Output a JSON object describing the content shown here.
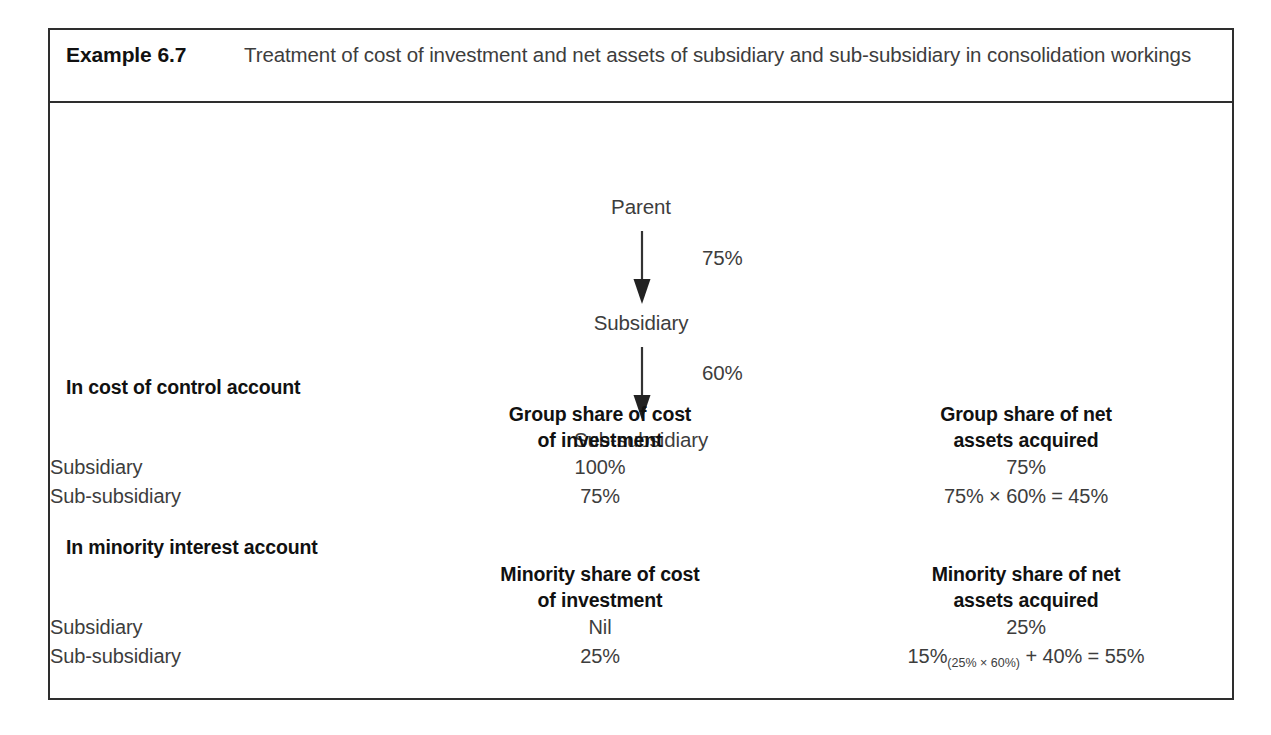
{
  "example": {
    "label": "Example 6.7",
    "title": "Treatment of cost of investment and net assets of subsidiary and sub-subsidiary in consolidation workings"
  },
  "diagram": {
    "type": "hierarchy-chain",
    "nodes": [
      {
        "id": "parent",
        "label": "Parent"
      },
      {
        "id": "subsidiary",
        "label": "Subsidiary"
      },
      {
        "id": "sub-subsidiary",
        "label": "Sub-subsidiary"
      }
    ],
    "edges": [
      {
        "from": "parent",
        "to": "subsidiary",
        "label": "75%"
      },
      {
        "from": "subsidiary",
        "to": "sub-subsidiary",
        "label": "60%"
      }
    ]
  },
  "sections": [
    {
      "id": "cost-of-control",
      "heading": "In cost of control account",
      "columns": [
        {
          "line1": "Group share of cost",
          "line2": "of investment"
        },
        {
          "line1": "Group share of net",
          "line2": "assets acquired"
        }
      ],
      "rows": [
        {
          "label": "Subsidiary",
          "col1": "100%",
          "col2": "75%",
          "col2_sub": ""
        },
        {
          "label": "Sub-subsidiary",
          "col1": "75%",
          "col2": "75% × 60% = 45%",
          "col2_sub": ""
        }
      ]
    },
    {
      "id": "minority-interest",
      "heading": "In minority interest account",
      "columns": [
        {
          "line1": "Minority share of cost",
          "line2": "of investment"
        },
        {
          "line1": "Minority share of net",
          "line2": "assets acquired"
        }
      ],
      "rows": [
        {
          "label": "Subsidiary",
          "col1": "Nil",
          "col2": "25%",
          "col2_sub": ""
        },
        {
          "label": "Sub-subsidiary",
          "col1": "25%",
          "col2_prefix": "15%",
          "col2_sub": "(25% × 60%)",
          "col2_suffix": " + 40% = 55%",
          "col2": "15%(25% × 60%) + 40% = 55%"
        }
      ]
    }
  ],
  "colors": {
    "border": "#2e2e2e",
    "heading_text": "#111111",
    "body_text": "#3d3d3d",
    "background": "#ffffff"
  }
}
